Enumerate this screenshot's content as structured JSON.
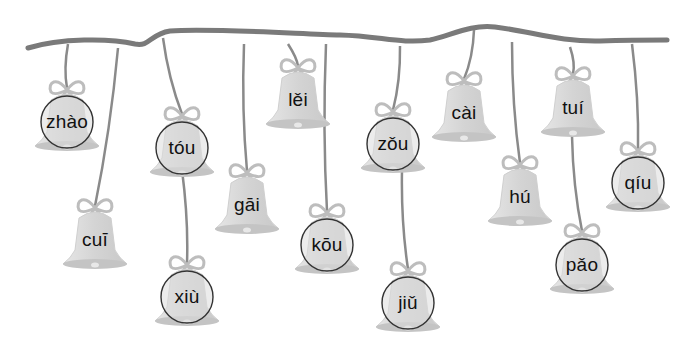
{
  "worksheet": {
    "description": "Bells hanging from a ribbon, each labeled with a pinyin syllable; some are circled",
    "colors": {
      "ribbon": "#7a7a7a",
      "string": "#8a8a8a",
      "bell_fill": "#d9d9d9",
      "bell_rim": "#c4c4c4",
      "bow": "#bdbdbd",
      "circle_stroke": "#333333",
      "text": "#111111"
    },
    "bells": [
      {
        "id": "zhao",
        "pinyin": "zhào",
        "x": 67,
        "y": 122,
        "circled": true,
        "hang_x": 68,
        "hang_top": 44
      },
      {
        "id": "cui",
        "pinyin": "cuī",
        "x": 95,
        "y": 240,
        "circled": false,
        "hang_x": 118,
        "hang_top": 48
      },
      {
        "id": "tou",
        "pinyin": "tóu",
        "x": 182,
        "y": 148,
        "circled": true,
        "hang_x": 163,
        "hang_top": 38
      },
      {
        "id": "xiu",
        "pinyin": "xiù",
        "x": 187,
        "y": 297,
        "circled": true,
        "hang_x": 182,
        "hang_top": 170
      },
      {
        "id": "gai",
        "pinyin": "gāi",
        "x": 247,
        "y": 205,
        "circled": false,
        "hang_x": 244,
        "hang_top": 44
      },
      {
        "id": "lei",
        "pinyin": "lěi",
        "x": 298,
        "y": 100,
        "circled": false,
        "hang_x": 288,
        "hang_top": 44
      },
      {
        "id": "kou",
        "pinyin": "kōu",
        "x": 327,
        "y": 245,
        "circled": true,
        "hang_x": 326,
        "hang_top": 44
      },
      {
        "id": "zou",
        "pinyin": "zǒu",
        "x": 393,
        "y": 144,
        "circled": true,
        "hang_x": 400,
        "hang_top": 46
      },
      {
        "id": "jiu",
        "pinyin": "jiǔ",
        "x": 408,
        "y": 303,
        "circled": true,
        "hang_x": 402,
        "hang_top": 170
      },
      {
        "id": "cai",
        "pinyin": "cài",
        "x": 464,
        "y": 113,
        "circled": false,
        "hang_x": 474,
        "hang_top": 30
      },
      {
        "id": "hu",
        "pinyin": "hú",
        "x": 520,
        "y": 197,
        "circled": false,
        "hang_x": 512,
        "hang_top": 42
      },
      {
        "id": "tui",
        "pinyin": "tuí",
        "x": 573,
        "y": 108,
        "circled": false,
        "hang_x": 570,
        "hang_top": 47
      },
      {
        "id": "pao",
        "pinyin": "pǎo",
        "x": 582,
        "y": 265,
        "circled": true,
        "hang_x": 572,
        "hang_top": 136
      },
      {
        "id": "qiu",
        "pinyin": "qíu",
        "x": 638,
        "y": 183,
        "circled": true,
        "hang_x": 632,
        "hang_top": 44
      }
    ]
  }
}
